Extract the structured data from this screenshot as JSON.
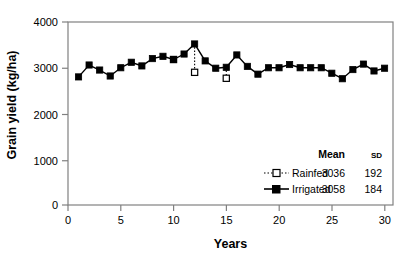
{
  "chart_data": {
    "type": "line",
    "title": "",
    "xlabel": "Years",
    "ylabel": "Grain yield (kg/ha)",
    "xlim": [
      0,
      30.8
    ],
    "ylim": [
      0,
      4000
    ],
    "xticks": [
      0,
      5,
      10,
      15,
      20,
      25,
      30
    ],
    "yticks": [
      0,
      1000,
      2000,
      3000,
      4000
    ],
    "xtick_labels": [
      "0",
      "5",
      "10",
      "15",
      "20",
      "25",
      "30"
    ],
    "ytick_labels": [
      "0",
      "1000",
      "2000",
      "3000",
      "4000"
    ],
    "grid": false,
    "legend_position": "lower-right-inside",
    "x": [
      1,
      2,
      3,
      4,
      5,
      6,
      7,
      8,
      9,
      10,
      11,
      12,
      13,
      14,
      15,
      16,
      17,
      18,
      19,
      20,
      21,
      22,
      23,
      24,
      25,
      26,
      27,
      28,
      29,
      30
    ],
    "series": [
      {
        "name": "Irrigated",
        "marker": "filled-square",
        "line": "solid",
        "color": "#000000",
        "mean": 3058,
        "sd": 184,
        "values": [
          2800,
          3060,
          2950,
          2820,
          3000,
          3120,
          3040,
          3200,
          3250,
          3180,
          3300,
          3520,
          3150,
          2990,
          3010,
          3280,
          3030,
          2860,
          3000,
          3000,
          3070,
          3000,
          3000,
          3000,
          2880,
          2760,
          2960,
          3080,
          2930,
          2990
        ]
      },
      {
        "name": "Rainfed",
        "marker": "open-square",
        "line": "dotted",
        "color": "#000000",
        "mean": 3036,
        "sd": 192,
        "points": [
          {
            "x": 10,
            "y": 3180
          },
          {
            "x": 12,
            "y": 2900
          },
          {
            "x": 15,
            "y": 2770
          }
        ],
        "note": "Rainfed values overlap irrigated for most years; open squares visible only where values diverge."
      }
    ]
  },
  "legend": {
    "header_mean": "Mean",
    "header_sd": "SD",
    "rows": [
      {
        "label": "Rainfed",
        "mean": "3036",
        "sd": "192"
      },
      {
        "label": "Irrigated",
        "mean": "3058",
        "sd": "184"
      }
    ]
  }
}
